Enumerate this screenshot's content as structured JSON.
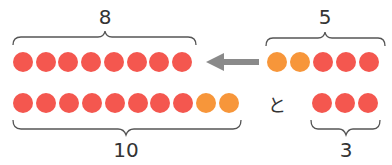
{
  "colors": {
    "red": "#f4574f",
    "orange": "#f7963a",
    "brace": "#555555",
    "arrow": "#8a8a8a",
    "text": "#333333"
  },
  "top_left": {
    "label": "8",
    "dots": [
      "red",
      "red",
      "red",
      "red",
      "red",
      "red",
      "red",
      "red"
    ]
  },
  "top_right": {
    "label": "5",
    "dots": [
      "orange",
      "orange",
      "red",
      "red",
      "red"
    ]
  },
  "arrow": {
    "direction": "left",
    "from": "top_right",
    "to": "top_left"
  },
  "bottom_left": {
    "label": "10",
    "dots": [
      "red",
      "red",
      "red",
      "red",
      "red",
      "red",
      "red",
      "red",
      "orange",
      "orange"
    ]
  },
  "connector": "と",
  "bottom_right": {
    "label": "3",
    "dots": [
      "red",
      "red",
      "red"
    ]
  }
}
